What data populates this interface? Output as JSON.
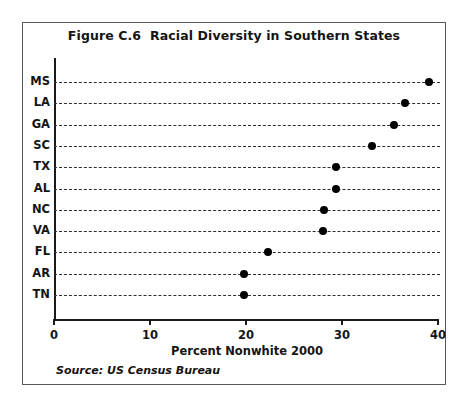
{
  "figure": {
    "title": "Figure C.6  Racial Diversity in Southern States",
    "source": "Source: US Census Bureau"
  },
  "chart_data": {
    "type": "scatter",
    "title": "Figure C.6  Racial Diversity in Southern States",
    "xlabel": "Percent Nonwhite 2000",
    "ylabel": "",
    "xlim": [
      0,
      40
    ],
    "xticks": [
      0,
      10,
      20,
      30,
      40
    ],
    "xtick_labels": [
      "0",
      "10",
      "20",
      "30",
      "40"
    ],
    "grid": true,
    "grid_style": "horizontal-dashed",
    "legend": "none",
    "orientation": "horizontal",
    "marker": "filled-circle",
    "marker_color": "#000000",
    "categories": [
      "MS",
      "LA",
      "GA",
      "SC",
      "TX",
      "AL",
      "NC",
      "VA",
      "FL",
      "AR",
      "TN"
    ],
    "values": [
      39.1,
      36.6,
      35.4,
      33.1,
      29.4,
      29.4,
      28.1,
      28.0,
      22.3,
      19.8,
      19.8
    ],
    "points": [
      {
        "category": "MS",
        "value": 39.1
      },
      {
        "category": "LA",
        "value": 36.6
      },
      {
        "category": "GA",
        "value": 35.4
      },
      {
        "category": "SC",
        "value": 33.1
      },
      {
        "category": "TX",
        "value": 29.4
      },
      {
        "category": "AL",
        "value": 29.4
      },
      {
        "category": "NC",
        "value": 28.1
      },
      {
        "category": "VA",
        "value": 28.0
      },
      {
        "category": "FL",
        "value": 22.3
      },
      {
        "category": "AR",
        "value": 19.8
      },
      {
        "category": "TN",
        "value": 19.8
      }
    ],
    "annotations": [
      "Source: US Census Bureau"
    ]
  },
  "colors": {
    "frame": "#5a5a5a",
    "axis": "#1a1a1a",
    "grid": "#2e2e2e",
    "marker": "#000000",
    "text": "#141414",
    "background": "#ffffff"
  }
}
